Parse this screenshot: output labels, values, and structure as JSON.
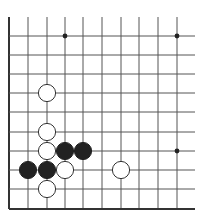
{
  "diagram": {
    "type": "go-board-fragment",
    "grid": {
      "columns_x": [
        9,
        28,
        47,
        65,
        83,
        102,
        121,
        139,
        158,
        177
      ],
      "rows_y": [
        36,
        55,
        74,
        93,
        112,
        132,
        151,
        170,
        189,
        209
      ],
      "top_open_y": 17,
      "right_open_x": 195,
      "left_edge": true,
      "bottom_edge": true,
      "line_color": "#555555",
      "edge_color": "#333333"
    },
    "star_points": [
      {
        "col": 3,
        "row": 0
      },
      {
        "col": 9,
        "row": 0
      },
      {
        "col": 9,
        "row": 6
      }
    ],
    "stones": [
      {
        "color": "white",
        "col": 2,
        "row": 3
      },
      {
        "color": "white",
        "col": 2,
        "row": 5
      },
      {
        "color": "white",
        "col": 2,
        "row": 6
      },
      {
        "color": "black",
        "col": 3,
        "row": 6
      },
      {
        "color": "black",
        "col": 4,
        "row": 6
      },
      {
        "color": "black",
        "col": 1,
        "row": 7
      },
      {
        "color": "black",
        "col": 2,
        "row": 7
      },
      {
        "color": "white",
        "col": 3,
        "row": 7
      },
      {
        "color": "white",
        "col": 6,
        "row": 7
      },
      {
        "color": "white",
        "col": 2,
        "row": 8
      }
    ],
    "stone_radius": 8.6,
    "colors": {
      "black_stone": "#222222",
      "white_stone": "#ffffff",
      "white_outline": "#333333"
    }
  }
}
